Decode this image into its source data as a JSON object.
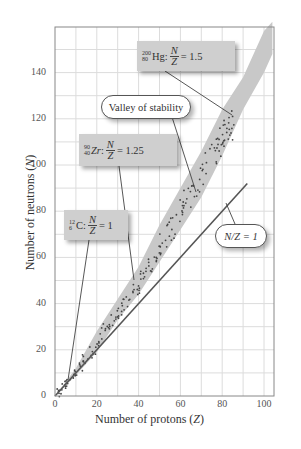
{
  "chart_data": {
    "type": "scatter",
    "title": "",
    "xlabel": "Number of protons (Z)",
    "ylabel": "Number of neutrons (N)",
    "xlim": [
      0,
      105
    ],
    "ylim": [
      0,
      160
    ],
    "grid": true,
    "x_ticks": [
      0,
      20,
      40,
      60,
      80,
      100
    ],
    "y_ticks": [
      0,
      20,
      40,
      60,
      80,
      100,
      120,
      140
    ],
    "series": [
      {
        "name": "Valley of stability (stable nuclei band)",
        "kind": "band",
        "color": "#c8c8c8",
        "points_lower": [
          [
            0,
            0
          ],
          [
            10,
            9
          ],
          [
            20,
            19
          ],
          [
            30,
            33
          ],
          [
            40,
            44
          ],
          [
            50,
            58
          ],
          [
            60,
            72
          ],
          [
            70,
            86
          ],
          [
            80,
            104
          ],
          [
            90,
            124
          ],
          [
            100,
            140
          ],
          [
            104,
            148
          ]
        ],
        "points_upper": [
          [
            0,
            0
          ],
          [
            10,
            12
          ],
          [
            20,
            28
          ],
          [
            30,
            42
          ],
          [
            40,
            56
          ],
          [
            50,
            74
          ],
          [
            60,
            90
          ],
          [
            70,
            106
          ],
          [
            80,
            124
          ],
          [
            90,
            138
          ],
          [
            100,
            158
          ],
          [
            104,
            162
          ]
        ]
      },
      {
        "name": "Stable nuclides",
        "kind": "dots",
        "color": "#444444",
        "center_line": [
          [
            0,
            0
          ],
          [
            10,
            10
          ],
          [
            20,
            22
          ],
          [
            30,
            36
          ],
          [
            40,
            48
          ],
          [
            50,
            64
          ],
          [
            60,
            80
          ],
          [
            70,
            96
          ],
          [
            80,
            112
          ],
          [
            85,
            120
          ]
        ]
      },
      {
        "name": "N/Z = 1",
        "kind": "line",
        "color": "#555555",
        "points": [
          [
            0,
            0
          ],
          [
            92,
            92
          ]
        ]
      }
    ],
    "annotations": [
      {
        "text": "¹²₆C: N/Z = 1",
        "points_to": [
          6,
          6
        ]
      },
      {
        "text": "⁹⁰₄₀Zr: N/Z = 1.25",
        "points_to": [
          40,
          50
        ]
      },
      {
        "text": "²⁰⁰₈₀Hg: N/Z = 1.5",
        "points_to": [
          80,
          120
        ]
      },
      {
        "text": "Valley of stability",
        "points_to": [
          62,
          88
        ]
      },
      {
        "text": "N/Z = 1",
        "points_to": [
          80,
          80
        ]
      }
    ]
  },
  "axes": {
    "xlabel": "Number of protons (",
    "xlabel_var": "Z",
    "xlabel_end": ")",
    "ylabel": "Number of neutrons (",
    "ylabel_var": "N",
    "ylabel_end": ")",
    "xticks": [
      "0",
      "20",
      "40",
      "60",
      "80",
      "100"
    ],
    "yticks": [
      "0",
      "20",
      "40",
      "60",
      "80",
      "100",
      "120",
      "140"
    ]
  },
  "labels": {
    "hg": {
      "mass": "200",
      "atomic": "80",
      "symbol": "Hg",
      "num": "N",
      "den": "Z",
      "value": "= 1.5"
    },
    "zr": {
      "mass": "90",
      "atomic": "40",
      "symbol": "Zr",
      "num": "N",
      "den": "Z",
      "value": "= 1.25"
    },
    "c": {
      "mass": "12",
      "atomic": "6",
      "symbol": "C",
      "num": "N",
      "den": "Z",
      "value": "= 1"
    },
    "valley": "Valley of stability",
    "nz1": "N/Z = 1"
  }
}
